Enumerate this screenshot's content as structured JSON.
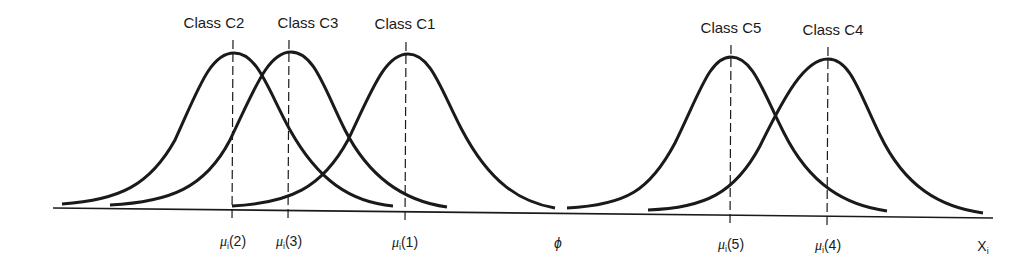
{
  "figure": {
    "type": "class-conditional-gaussian-distributions",
    "axis": {
      "label": "X",
      "label_subscript": "i",
      "origin_symbol": "ϕ"
    },
    "classes": [
      {
        "id": "C2",
        "label": "Class C2",
        "mean_label": "μ",
        "mean_subscript": "i",
        "mean_index": "(2)"
      },
      {
        "id": "C3",
        "label": "Class C3",
        "mean_label": "μ",
        "mean_subscript": "i",
        "mean_index": "(3)"
      },
      {
        "id": "C1",
        "label": "Class C1",
        "mean_label": "μ",
        "mean_subscript": "i",
        "mean_index": "(1)"
      },
      {
        "id": "C5",
        "label": "Class C5",
        "mean_label": "μ",
        "mean_subscript": "i",
        "mean_index": "(5)"
      },
      {
        "id": "C4",
        "label": "Class C4",
        "mean_label": "μ",
        "mean_subscript": "i",
        "mean_index": "(4)"
      }
    ],
    "colors": {
      "ink": "#1a1a1a",
      "background": "#ffffff"
    }
  }
}
